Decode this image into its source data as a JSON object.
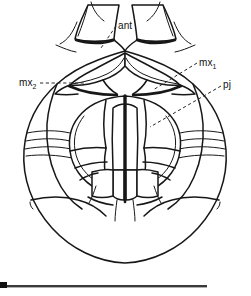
{
  "figure": {
    "kind": "scientific-line-drawing",
    "background_color": "#ffffff",
    "ink_color": "#171717",
    "width": 251,
    "height": 296
  },
  "labels": {
    "antenna": {
      "text": "ant",
      "subscript": ""
    },
    "maxilla_one": {
      "text": "mx",
      "subscript": "1"
    },
    "maxilla_two": {
      "text": "mx",
      "subscript": "2"
    },
    "palp_joint": {
      "text": "pj",
      "subscript": ""
    }
  },
  "scale_bar": {
    "caption": "",
    "color": "#3a3a3a"
  }
}
